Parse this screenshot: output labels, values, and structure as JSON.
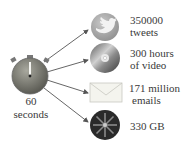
{
  "center": {
    "icon": "stopwatch-icon",
    "line1": "60",
    "line2": "seconds"
  },
  "items": [
    {
      "icon": "twitter-bird-icon",
      "line1": "350000",
      "line2": "tweets"
    },
    {
      "icon": "video-disc-icon",
      "line1": "300 hours",
      "line2": "of video"
    },
    {
      "icon": "envelope-icon",
      "line1": "171 million",
      "line2": "emails"
    },
    {
      "icon": "hard-disk-icon",
      "line1": "330 GB",
      "line2": ""
    }
  ],
  "colors": {
    "arrow": "#555555",
    "stopwatch": "#7a7a72",
    "twitter": "#a8a8a8",
    "disc": "#8a8a8a",
    "envelope": "#d8d8d0",
    "disk": "#2a2a2a"
  }
}
